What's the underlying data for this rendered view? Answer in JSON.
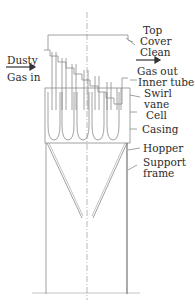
{
  "diagram": {
    "type": "multicyclone-dust-collector",
    "labels": {
      "dusty_gas_in_line1": "Dusty",
      "dusty_gas_in_line2": "Gas in",
      "top_cover_line1": "Top",
      "top_cover_line2": "Cover",
      "clean_gas_out_line1": "Clean",
      "clean_gas_out_line2": "Gas out",
      "inner_tube": "Inner tube",
      "swirl_vane_line1": "Swirl",
      "swirl_vane_line2": "vane",
      "cell": "Cell",
      "casing": "Casing",
      "hopper": "Hopper",
      "support_frame_line1": "Support",
      "support_frame_line2": "frame"
    },
    "colors": {
      "line": "#8a8a8a",
      "dark_line": "#555555",
      "text": "#2b2b2b"
    }
  }
}
